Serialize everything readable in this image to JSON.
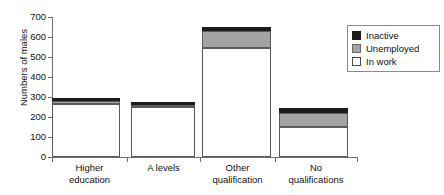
{
  "chart_data": {
    "type": "bar",
    "subtype": "stacked-bar",
    "title": "",
    "xlabel": "",
    "ylabel": "Numbers of males",
    "ylim": [
      0,
      700
    ],
    "yticks": [
      0,
      100,
      200,
      300,
      400,
      500,
      600,
      700
    ],
    "grid": false,
    "legend_position": "upper right",
    "categories": [
      "Higher education",
      "A levels",
      "Other qualification",
      "No qualifications"
    ],
    "category_lines": [
      [
        "Higher",
        "education"
      ],
      [
        "A levels",
        ""
      ],
      [
        "Other",
        "qualification"
      ],
      [
        "No",
        "qualifications"
      ]
    ],
    "series": [
      {
        "name": "In work",
        "color": "#ffffff",
        "values": [
          265,
          250,
          545,
          150
        ]
      },
      {
        "name": "Unemployed",
        "color": "#a3a3a3",
        "values": [
          15,
          10,
          85,
          70
        ]
      },
      {
        "name": "Inactive",
        "color": "#1c1c1c",
        "values": [
          15,
          15,
          20,
          25
        ]
      }
    ],
    "totals": [
      295,
      275,
      650,
      245
    ]
  },
  "legend": {
    "entries": [
      {
        "label": "Inactive",
        "swatch": "black-square-swatch"
      },
      {
        "label": "Unemployed",
        "swatch": "gray-square-swatch"
      },
      {
        "label": "In work",
        "swatch": "white-square-swatch"
      }
    ]
  },
  "axes": {
    "y_title": "Numbers of males",
    "y_tick_labels": [
      "700",
      "600",
      "500",
      "400",
      "300",
      "200",
      "100",
      "0"
    ]
  }
}
